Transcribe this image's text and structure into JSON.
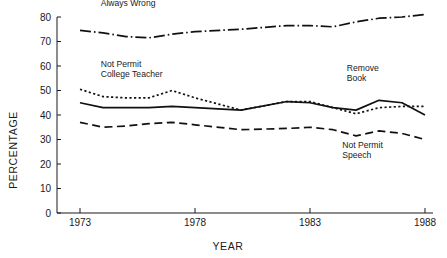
{
  "chart_data": {
    "type": "line",
    "title": "",
    "xlabel": "YEAR",
    "ylabel": "PERCENTAGE",
    "xlim": [
      1972,
      1988
    ],
    "ylim": [
      0,
      80
    ],
    "x_ticks": [
      1973,
      1978,
      1983,
      1988
    ],
    "x_tick_labels": [
      "1973",
      "1978",
      "1983",
      "1988"
    ],
    "y_ticks": [
      0,
      10,
      20,
      30,
      40,
      50,
      60,
      70,
      80
    ],
    "y_tick_labels": [
      "0",
      "10",
      "20",
      "30",
      "40",
      "50",
      "60",
      "70",
      "80"
    ],
    "grid": false,
    "legend": "inline-annotations",
    "x": [
      1973,
      1974,
      1975,
      1976,
      1977,
      1978,
      1980,
      1982,
      1983,
      1984,
      1985,
      1986,
      1987,
      1988
    ],
    "series": [
      {
        "name": "Always Wrong",
        "style": "dash-dot",
        "color": "#111111",
        "values": [
          74.5,
          73.5,
          72.0,
          71.5,
          73.0,
          74.0,
          75.0,
          76.5,
          76.5,
          76.0,
          78.0,
          79.5,
          80.0,
          81.0
        ]
      },
      {
        "name": "Not Permit College Teacher",
        "style": "dotted",
        "color": "#111111",
        "values": [
          50.5,
          47.5,
          47.0,
          47.0,
          50.0,
          47.0,
          42.0,
          45.5,
          45.5,
          43.0,
          40.5,
          43.0,
          43.5,
          43.5
        ]
      },
      {
        "name": "Remove Book",
        "style": "solid",
        "color": "#111111",
        "values": [
          45.0,
          43.0,
          43.0,
          43.0,
          43.5,
          43.0,
          42.0,
          45.5,
          45.0,
          43.0,
          42.0,
          46.0,
          45.0,
          40.0
        ]
      },
      {
        "name": "Not Permit Speech",
        "style": "dashed",
        "color": "#111111",
        "values": [
          37.0,
          35.0,
          35.5,
          36.5,
          37.0,
          36.0,
          34.0,
          34.5,
          35.0,
          34.0,
          31.5,
          33.5,
          32.5,
          30.0
        ]
      }
    ],
    "annotations": [
      {
        "id": "always-wrong",
        "lines": [
          "Always Wrong"
        ],
        "x": 1973.9,
        "y": 84.5
      },
      {
        "id": "not-permit-college-teacher",
        "lines": [
          "Not Permit",
          "College Teacher"
        ],
        "x": 1973.9,
        "y": 59.5
      },
      {
        "id": "remove-book",
        "lines": [
          "Remove",
          "Book"
        ],
        "x": 1984.6,
        "y": 58.0
      },
      {
        "id": "not-permit-speech",
        "lines": [
          "Not Permit",
          "Speech"
        ],
        "x": 1984.4,
        "y": 26.5
      }
    ]
  }
}
